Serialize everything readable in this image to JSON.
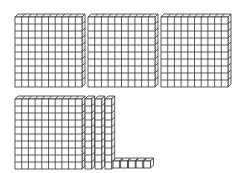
{
  "diagram": {
    "represented_value": 435,
    "line_color": "#333333",
    "fill_color": "#ffffff",
    "side_fill_color": "#f2f2f2",
    "cell_w": 6.7,
    "cell_h": 7.0,
    "depth_x": 3,
    "depth_y": 3,
    "hundreds": {
      "label": "hundreds flats",
      "count": 4,
      "positions": [
        {
          "x": 15,
          "y": 17
        },
        {
          "x": 88,
          "y": 17
        },
        {
          "x": 161,
          "y": 17
        },
        {
          "x": 15,
          "y": 99
        }
      ]
    },
    "tens": {
      "label": "tens rods",
      "count": 3,
      "positions": [
        {
          "x": 85,
          "y": 99
        },
        {
          "x": 95,
          "y": 99
        },
        {
          "x": 105,
          "y": 99
        }
      ]
    },
    "ones": {
      "label": "unit cubes",
      "count": 5,
      "positions": [
        {
          "x": 113,
          "y": 161
        },
        {
          "x": 120.7,
          "y": 161
        },
        {
          "x": 128.4,
          "y": 161
        },
        {
          "x": 136.1,
          "y": 161
        },
        {
          "x": 143.8,
          "y": 161
        }
      ]
    }
  }
}
